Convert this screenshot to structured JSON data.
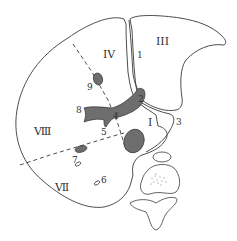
{
  "diagram": {
    "type": "anatomical cross-section (liver segments)",
    "segment_labels": {
      "IV": "IV",
      "III": "III",
      "VIII": "Ⅷ",
      "VII": "Ⅶ",
      "I": "I"
    },
    "number_labels": {
      "n1_top": "1",
      "n1_mid": "1",
      "n2": "2",
      "n3": "3",
      "n4": "4",
      "n5": "5",
      "n6": "6",
      "n7": "7",
      "n8": "8",
      "n9": "9"
    },
    "colors": {
      "outline": "#3a3a3a",
      "vessel_fill": "#6e6e6e",
      "background": "#ffffff"
    }
  }
}
